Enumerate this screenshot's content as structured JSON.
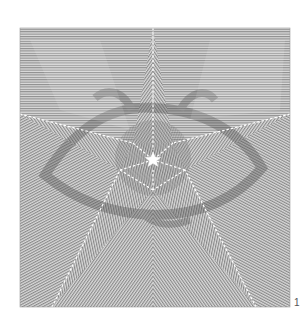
{
  "figure": {
    "number_label": "1",
    "frame": {
      "x": 20,
      "y": 28,
      "width": 270,
      "height": 279
    },
    "colors": {
      "background": "#ffffff",
      "line_color": "#8a8a8a",
      "field_base": "#d8d8d8",
      "dash_color": "#ffffff",
      "center_star": "#ffffff",
      "hidden_figure_shade": "#5a5a5a"
    },
    "center_star": {
      "cx": 153,
      "cy": 160,
      "outer_radius": 8,
      "inner_radius": 3.4
    },
    "star_outline": {
      "outer_points": [
        [
          153,
          28
        ],
        [
          290,
          114
        ],
        [
          256,
          307
        ],
        [
          52,
          307
        ],
        [
          20,
          114
        ]
      ],
      "inner_points": [
        [
          173,
          143
        ],
        [
          185,
          170
        ],
        [
          153,
          190
        ],
        [
          120,
          170
        ],
        [
          133,
          143
        ]
      ]
    },
    "hidden_figure": {
      "description": "faint darker eye-shaped figure embedded in line pattern",
      "eye_center": [
        153,
        158
      ]
    }
  }
}
